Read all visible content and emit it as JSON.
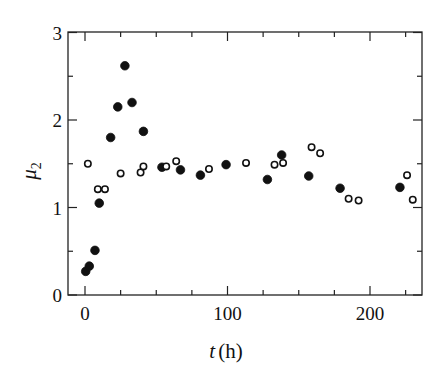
{
  "chart_data": {
    "type": "scatter",
    "title": "",
    "xlabel": "t (h)",
    "xlabel_var": "t",
    "xlabel_unit": "(h)",
    "ylabel": "μ2",
    "ylabel_var": "μ",
    "ylabel_sub": "2",
    "xlim": [
      -12,
      237
    ],
    "ylim": [
      0,
      3
    ],
    "x_ticks_major": [
      0,
      100,
      200
    ],
    "x_tick_labels": [
      "0",
      "100",
      "200"
    ],
    "x_ticks_minor": [
      25,
      50,
      75,
      125,
      150,
      175,
      225
    ],
    "y_ticks_major": [
      0,
      1,
      2,
      3
    ],
    "y_tick_labels": [
      "0",
      "1",
      "2",
      "3"
    ],
    "y_ticks_minor": [
      0.5,
      1.5,
      2.5
    ],
    "grid": false,
    "legend": null,
    "series": [
      {
        "name": "filled circles",
        "marker": "filled-circle",
        "points": [
          [
            0.5,
            0.27
          ],
          [
            3,
            0.33
          ],
          [
            7,
            0.51
          ],
          [
            10,
            1.05
          ],
          [
            18,
            1.8
          ],
          [
            23,
            2.15
          ],
          [
            28,
            2.62
          ],
          [
            33,
            2.2
          ],
          [
            41,
            1.87
          ],
          [
            54,
            1.46
          ],
          [
            67,
            1.43
          ],
          [
            81,
            1.37
          ],
          [
            99,
            1.49
          ],
          [
            128,
            1.32
          ],
          [
            138,
            1.6
          ],
          [
            157,
            1.36
          ],
          [
            179,
            1.22
          ],
          [
            221,
            1.23
          ]
        ]
      },
      {
        "name": "open circles",
        "marker": "open-circle",
        "points": [
          [
            2,
            1.5
          ],
          [
            9,
            1.21
          ],
          [
            14,
            1.21
          ],
          [
            25,
            1.39
          ],
          [
            39,
            1.4
          ],
          [
            41,
            1.47
          ],
          [
            57,
            1.47
          ],
          [
            64,
            1.53
          ],
          [
            87,
            1.44
          ],
          [
            113,
            1.51
          ],
          [
            133,
            1.49
          ],
          [
            139,
            1.51
          ],
          [
            159,
            1.69
          ],
          [
            165,
            1.62
          ],
          [
            185,
            1.1
          ],
          [
            192,
            1.08
          ],
          [
            226,
            1.37
          ],
          [
            230,
            1.09
          ]
        ]
      }
    ]
  }
}
